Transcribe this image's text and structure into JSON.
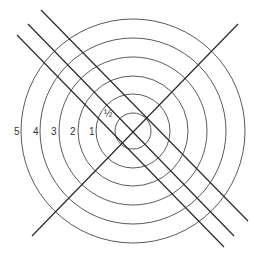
{
  "diagram": {
    "title": "",
    "center": {
      "x": 133,
      "y": 131
    },
    "colors": {
      "ring": "#5a5a5a",
      "line": "#2a2a2a",
      "label": "#333333",
      "background": "#ffffff"
    },
    "rings": [
      {
        "label": "½",
        "radius": 18
      },
      {
        "label": "1",
        "radius": 37
      },
      {
        "label": "2",
        "radius": 55
      },
      {
        "label": "3",
        "radius": 74
      },
      {
        "label": "4",
        "radius": 93
      },
      {
        "label": "5",
        "radius": 112
      }
    ],
    "labels": [
      {
        "text": "5",
        "x": 14,
        "y": 135
      },
      {
        "text": "4",
        "x": 33,
        "y": 135
      },
      {
        "text": "3",
        "x": 51,
        "y": 135
      },
      {
        "text": "2",
        "x": 70,
        "y": 135
      },
      {
        "text": "1",
        "x": 89,
        "y": 135
      },
      {
        "text": "½",
        "x": 104,
        "y": 117
      }
    ],
    "lines": [
      {
        "name": "diagonal-rising",
        "x1": 32,
        "y1": 236,
        "x2": 238,
        "y2": 24
      },
      {
        "name": "diagonal-falling-1",
        "x1": 41,
        "y1": 10,
        "x2": 248,
        "y2": 221
      },
      {
        "name": "diagonal-falling-2",
        "x1": 28,
        "y1": 24,
        "x2": 234,
        "y2": 236
      },
      {
        "name": "diagonal-falling-3",
        "x1": 17,
        "y1": 35,
        "x2": 224,
        "y2": 247
      }
    ]
  }
}
